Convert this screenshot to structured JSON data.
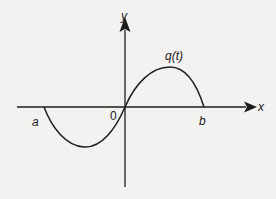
{
  "diagram": {
    "type": "function-graph",
    "function_label": "q(t)",
    "axes": {
      "x_label": "x",
      "y_label": "y",
      "origin_label": "0"
    },
    "points": {
      "a_label": "a",
      "b_label": "b"
    },
    "colors": {
      "background": "#f3f2f0",
      "ink": "#1c1c1c"
    }
  }
}
